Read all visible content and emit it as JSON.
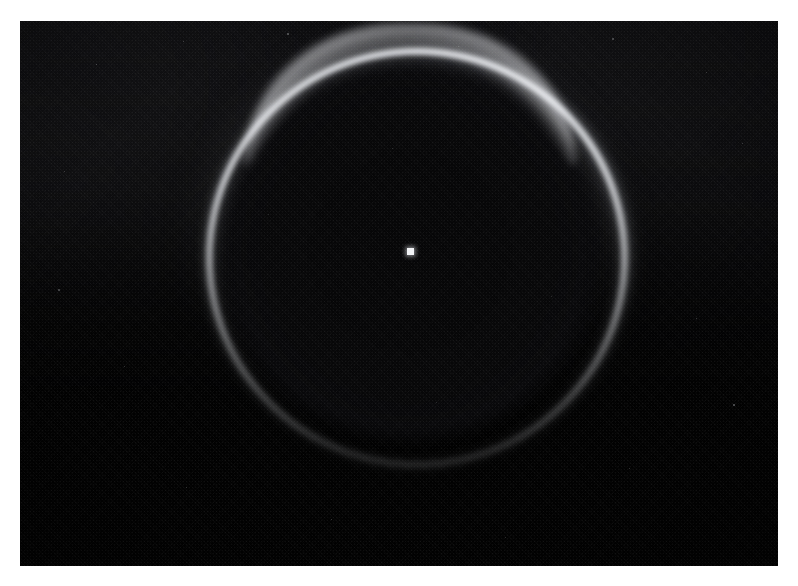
{
  "page": {
    "width": 798,
    "height": 586,
    "background_color": "#ffffff",
    "kind": "astronomical-photograph",
    "caption": ""
  },
  "plate": {
    "name": "backlit-limb-ring-plate",
    "left": 20,
    "top": 21,
    "width": 758,
    "height": 545,
    "background_color": "#050506",
    "description": "Dark star-field plate showing a thin luminous ring (forward-scattered light around a backlit body), brightest along the upper arc and fading toward the bottom, with a single bright point source near the center.",
    "texture": "halftone print grain"
  },
  "features": {
    "ring": {
      "name": "luminous-limb-ring",
      "center_x": 410,
      "center_y": 251,
      "radius_x": 204,
      "radius_y": 203,
      "stroke_width_px": 7,
      "core_color": "#ecedf2",
      "glow_color": "#9a9ca2",
      "brightest_position": "top",
      "faintest_position": "bottom",
      "top_arc_y": 87,
      "bottom_arc_y": 500,
      "left_arc_x": 207,
      "right_arc_x": 617
    },
    "disc": {
      "name": "occulting-dark-disc",
      "center_x": 410,
      "center_y": 251,
      "radius": 197,
      "color": "#060607"
    },
    "center_point": {
      "name": "central-point-source",
      "x": 410,
      "y": 251,
      "size_px": 7,
      "color": "#f2f3f6"
    },
    "background": {
      "name": "sky-background",
      "color": "#0a0a0c",
      "noise": "film grain / halftone"
    }
  },
  "speckles": [
    {
      "x": 96,
      "y": 64,
      "s": 1.4,
      "o": 0.42
    },
    {
      "x": 183,
      "y": 41,
      "s": 1.2,
      "o": 0.34
    },
    {
      "x": 287,
      "y": 33,
      "s": 1.6,
      "o": 0.38
    },
    {
      "x": 458,
      "y": 46,
      "s": 1.3,
      "o": 0.3
    },
    {
      "x": 612,
      "y": 38,
      "s": 1.5,
      "o": 0.36
    },
    {
      "x": 706,
      "y": 72,
      "s": 1.2,
      "o": 0.32
    },
    {
      "x": 742,
      "y": 143,
      "s": 1.4,
      "o": 0.34
    },
    {
      "x": 64,
      "y": 171,
      "s": 1.3,
      "o": 0.3
    },
    {
      "x": 58,
      "y": 289,
      "s": 1.5,
      "o": 0.33
    },
    {
      "x": 124,
      "y": 366,
      "s": 1.2,
      "o": 0.28
    },
    {
      "x": 696,
      "y": 318,
      "s": 1.3,
      "o": 0.31
    },
    {
      "x": 733,
      "y": 404,
      "s": 1.6,
      "o": 0.4
    },
    {
      "x": 629,
      "y": 468,
      "s": 1.2,
      "o": 0.29
    },
    {
      "x": 331,
      "y": 519,
      "s": 1.4,
      "o": 0.3
    },
    {
      "x": 186,
      "y": 487,
      "s": 1.2,
      "o": 0.27
    },
    {
      "x": 505,
      "y": 537,
      "s": 1.3,
      "o": 0.26
    },
    {
      "x": 392,
      "y": 148,
      "s": 1.1,
      "o": 0.22
    },
    {
      "x": 268,
      "y": 214,
      "s": 1.1,
      "o": 0.2
    },
    {
      "x": 551,
      "y": 296,
      "s": 1.1,
      "o": 0.22
    },
    {
      "x": 436,
      "y": 402,
      "s": 1.1,
      "o": 0.2
    }
  ]
}
